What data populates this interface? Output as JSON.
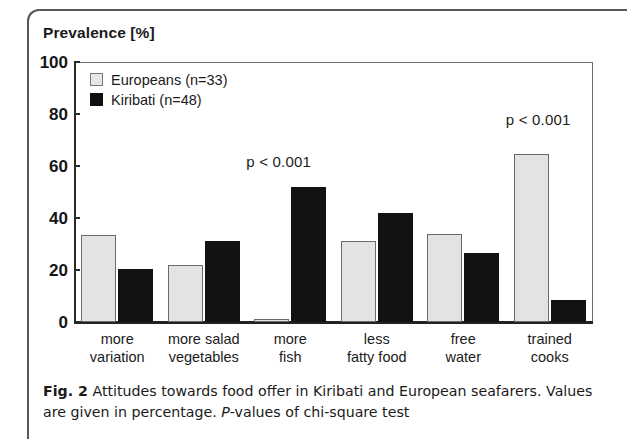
{
  "figure": {
    "caption_label": "Fig. 2",
    "caption_text": " Attitudes towards food offer in Kiribati and European seafarers. Values are given in percentage. ",
    "caption_italic": "P",
    "caption_tail": "-values of chi-square test"
  },
  "chart_data": {
    "type": "bar",
    "title": "",
    "ylabel": "Prevalence  [%]",
    "xlabel": "",
    "ylim": [
      0,
      100
    ],
    "yticks": [
      0,
      20,
      40,
      60,
      80,
      100
    ],
    "ytick_labels": [
      "0",
      "20",
      "40",
      "60",
      "80",
      "100"
    ],
    "grid": false,
    "legend_position": "upper-left-inside",
    "categories": [
      "more variation",
      "more salad vegetables",
      "more fish",
      "less fatty food",
      "free water",
      "trained cooks"
    ],
    "category_lines": [
      [
        "more",
        "variation"
      ],
      [
        "more salad",
        "vegetables"
      ],
      [
        "more",
        "fish"
      ],
      [
        "less",
        "fatty food"
      ],
      [
        "free",
        "water"
      ],
      [
        "trained",
        "cooks"
      ]
    ],
    "series": [
      {
        "name": "Europeans (n=33)",
        "color": "#e3e3e3",
        "values": [
          33.5,
          22.0,
          1.0,
          31.0,
          34.0,
          64.5
        ]
      },
      {
        "name": "Kiribati (n=48)",
        "color": "#121212",
        "values": [
          20.5,
          31.0,
          52.0,
          42.0,
          26.5,
          8.5
        ]
      }
    ],
    "annotations": [
      {
        "text": "p < 0.001",
        "category": "more fish",
        "value": 62
      },
      {
        "text": "p < 0.001",
        "category": "trained cooks",
        "value": 78
      }
    ]
  },
  "legend": {
    "items": [
      {
        "label": "Europeans (n=33)",
        "swatch": "europeans"
      },
      {
        "label": "Kiribati (n=48)",
        "swatch": "kiribati"
      }
    ]
  }
}
